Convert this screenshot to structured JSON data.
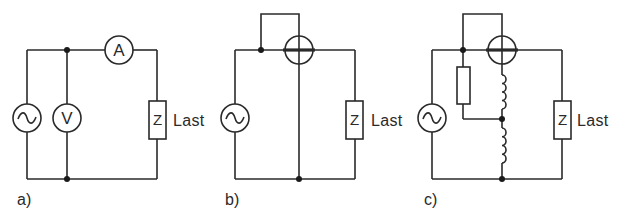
{
  "figure": {
    "panels": [
      {
        "id": "a",
        "label": "a)",
        "source_symbol": "ac-source",
        "voltmeter_label": "V",
        "ammeter_label": "A",
        "load_symbol": "Z",
        "load_label": "Last"
      },
      {
        "id": "b",
        "label": "b)",
        "source_symbol": "ac-source",
        "meter_symbol": "wattmeter",
        "load_symbol": "Z",
        "load_label": "Last"
      },
      {
        "id": "c",
        "label": "c)",
        "source_symbol": "ac-source",
        "meter_symbol": "wattmeter",
        "extra_components": [
          "resistor",
          "inductor",
          "inductor"
        ],
        "load_symbol": "Z",
        "load_label": "Last"
      }
    ],
    "colors": {
      "line": "#2a2a2a",
      "background": "#ffffff"
    }
  }
}
